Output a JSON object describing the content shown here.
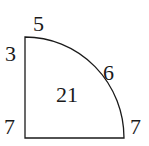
{
  "diagram": {
    "shape": "quarter-circle",
    "labels": {
      "top": "5",
      "left_top": "3",
      "arc": "6",
      "center": "21",
      "bottom_left": "7",
      "bottom_right": "7"
    },
    "stroke_color": "#1a1a1a",
    "background": "#ffffff"
  }
}
